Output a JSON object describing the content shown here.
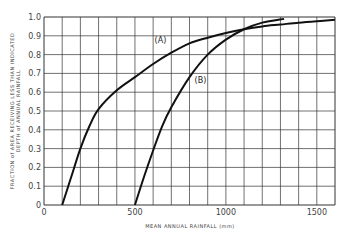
{
  "chart_data": {
    "type": "line",
    "title": "",
    "xlabel": "MEAN ANNUAL RAINFALL (mm)",
    "ylabel_line1": "FRACTION of AREA RECEIVING LESS THAN INDICATED",
    "ylabel_line2": "DEPTH of ANNUAL RAINFALL",
    "xlim": [
      0,
      1600
    ],
    "ylim": [
      0,
      1.0
    ],
    "grid": true,
    "x_ticks": [
      {
        "value": 0,
        "label": "0"
      },
      {
        "value": 500,
        "label": "500"
      },
      {
        "value": 1000,
        "label": "1000"
      },
      {
        "value": 1500,
        "label": "1500"
      }
    ],
    "y_ticks": [
      {
        "value": 0,
        "label": "0"
      },
      {
        "value": 0.1,
        "label": "0.1"
      },
      {
        "value": 0.2,
        "label": "0.2"
      },
      {
        "value": 0.3,
        "label": "0.3"
      },
      {
        "value": 0.4,
        "label": "0.4"
      },
      {
        "value": 0.5,
        "label": "0.5"
      },
      {
        "value": 0.6,
        "label": "0.6"
      },
      {
        "value": 0.7,
        "label": "0.7"
      },
      {
        "value": 0.8,
        "label": "0.8"
      },
      {
        "value": 0.9,
        "label": "0.9"
      },
      {
        "value": 1.0,
        "label": "1.0"
      }
    ],
    "series": [
      {
        "name": "(A)",
        "label_pos": [
          640,
          0.86
        ],
        "x": [
          100,
          150,
          200,
          250,
          300,
          400,
          500,
          600,
          700,
          800,
          900,
          1000,
          1100,
          1200,
          1300,
          1400,
          1500,
          1600
        ],
        "values": [
          0,
          0.15,
          0.3,
          0.42,
          0.51,
          0.61,
          0.68,
          0.75,
          0.81,
          0.86,
          0.89,
          0.915,
          0.935,
          0.95,
          0.96,
          0.97,
          0.978,
          0.985
        ]
      },
      {
        "name": "(B)",
        "label_pos": [
          860,
          0.65
        ],
        "x": [
          500,
          550,
          600,
          650,
          700,
          800,
          900,
          1000,
          1100,
          1200,
          1320
        ],
        "values": [
          0,
          0.15,
          0.29,
          0.42,
          0.52,
          0.68,
          0.8,
          0.88,
          0.935,
          0.97,
          0.99
        ]
      }
    ]
  }
}
